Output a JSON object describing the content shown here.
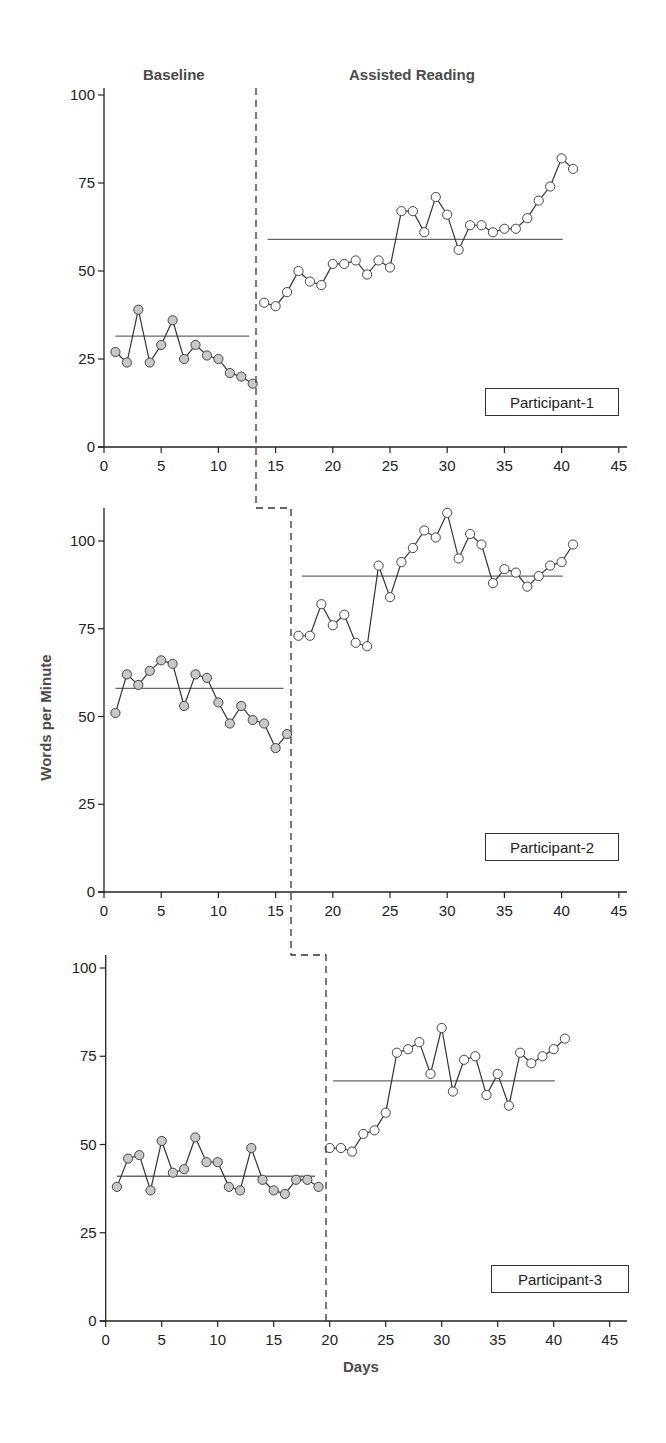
{
  "phases": {
    "baseline_label": "Baseline",
    "treatment_label": "Assisted Reading"
  },
  "axes": {
    "ylabel": "Words per Minute",
    "xlabel": "Days",
    "x_ticks": [
      0,
      5,
      10,
      15,
      20,
      25,
      30,
      35,
      40,
      45
    ],
    "y_ticks": [
      0,
      25,
      50,
      75,
      100
    ]
  },
  "colors": {
    "baseline_marker_fill": "#c8c8c8",
    "treatment_marker_fill": "#ffffff",
    "line": "#333333",
    "mean_line": "#666666",
    "axis": "#222222"
  },
  "panels": [
    {
      "legend": "Participant-1"
    },
    {
      "legend": "Participant-2"
    },
    {
      "legend": "Participant-3"
    }
  ],
  "chart_data": {
    "type": "line",
    "title": "",
    "xlabel": "Days",
    "ylabel": "Words per Minute",
    "subplots": "multiple-baseline design, 3 stacked panels",
    "phase_labels": [
      "Baseline",
      "Assisted Reading"
    ],
    "xlim": [
      0,
      45
    ],
    "ylim": [
      0,
      100
    ],
    "grid": false,
    "panels": [
      {
        "name": "Participant-1",
        "phase_change_day": 13.5,
        "baseline": {
          "days": [
            1,
            2,
            3,
            4,
            5,
            6,
            7,
            8,
            9,
            10,
            11,
            12,
            13
          ],
          "values": [
            27,
            24,
            39,
            24,
            29,
            36,
            25,
            29,
            26,
            25,
            21,
            20,
            18
          ],
          "mean": 31.5
        },
        "treatment": {
          "days": [
            14,
            15,
            16,
            17,
            18,
            19,
            20,
            21,
            22,
            23,
            24,
            25,
            26,
            27,
            28,
            29,
            30,
            31,
            32,
            33,
            34,
            35,
            36,
            37,
            38,
            39,
            40,
            41
          ],
          "values": [
            41,
            40,
            44,
            50,
            47,
            46,
            52,
            52,
            53,
            49,
            53,
            51,
            67,
            67,
            61,
            71,
            66,
            56,
            63,
            63,
            61,
            62,
            62,
            65,
            70,
            74,
            82,
            79
          ],
          "mean": 59
        }
      },
      {
        "name": "Participant-2",
        "phase_change_day": 16.5,
        "baseline": {
          "days": [
            1,
            2,
            3,
            4,
            5,
            6,
            7,
            8,
            9,
            10,
            11,
            12,
            13,
            14,
            15,
            16
          ],
          "values": [
            51,
            62,
            59,
            63,
            66,
            65,
            53,
            62,
            61,
            54,
            48,
            53,
            49,
            48,
            41,
            45
          ],
          "mean": 58
        },
        "treatment": {
          "days": [
            17,
            18,
            19,
            20,
            21,
            22,
            23,
            24,
            25,
            26,
            27,
            28,
            29,
            30,
            31,
            32,
            33,
            34,
            35,
            36,
            37,
            38,
            39,
            40,
            41
          ],
          "values": [
            73,
            73,
            82,
            76,
            79,
            71,
            70,
            93,
            84,
            94,
            98,
            103,
            101,
            108,
            95,
            102,
            99,
            88,
            92,
            91,
            87,
            90,
            93,
            94,
            99
          ],
          "mean": 90
        }
      },
      {
        "name": "Participant-3",
        "phase_change_day": 19.5,
        "baseline": {
          "days": [
            1,
            2,
            3,
            4,
            5,
            6,
            7,
            8,
            9,
            10,
            11,
            12,
            13,
            14,
            15,
            16,
            17,
            18,
            19
          ],
          "values": [
            38,
            46,
            47,
            37,
            51,
            42,
            43,
            52,
            45,
            45,
            38,
            37,
            49,
            40,
            37,
            36,
            40,
            40,
            38
          ],
          "mean": 41
        },
        "treatment": {
          "days": [
            20,
            21,
            22,
            23,
            24,
            25,
            26,
            27,
            28,
            29,
            30,
            31,
            32,
            33,
            34,
            35,
            36,
            37,
            38,
            39,
            40,
            41
          ],
          "values": [
            49,
            49,
            48,
            53,
            54,
            59,
            76,
            77,
            79,
            70,
            83,
            65,
            74,
            75,
            64,
            70,
            61,
            76,
            73,
            75,
            77,
            80
          ],
          "mean": 68
        }
      }
    ]
  }
}
